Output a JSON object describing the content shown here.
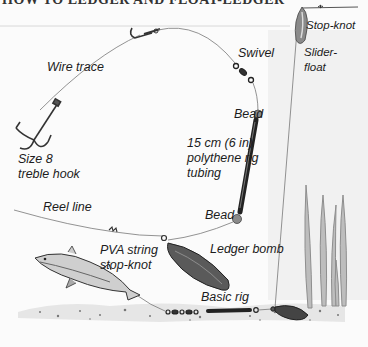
{
  "title": "HOW TO LEDGER AND FLOAT-LEDGER",
  "labels": {
    "wire_trace": "Wire trace",
    "swivel": "Swivel",
    "stop_knot_top": "Stop-knot",
    "slider_float_1": "Slider-",
    "slider_float_2": "float",
    "bead_top": "Bead",
    "tubing_1": "15 cm (6 in)",
    "tubing_2": "polythene rig",
    "tubing_3": "tubing",
    "hook_1": "Size 8",
    "hook_2": "treble hook",
    "reel_line": "Reel line",
    "bead_bottom": "Bead",
    "pva_1": "PVA string",
    "pva_2": "stop-knot",
    "ledger_bomb": "Ledger bomb",
    "basic_rig": "Basic rig"
  },
  "colors": {
    "ink": "#1c1c1c",
    "line": "#6a6a6a",
    "lead": "#555555",
    "bead": "#8a8a8a",
    "weed": "#9a9a9a",
    "float": "#7d7d7d"
  }
}
